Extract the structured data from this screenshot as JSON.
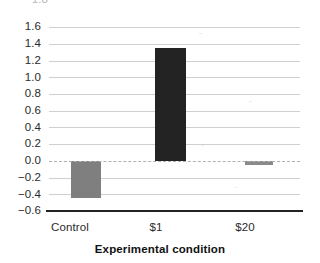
{
  "chart_data": {
    "type": "bar",
    "title": "",
    "xlabel": "Experimental condition",
    "ylabel": "",
    "categories": [
      "Control",
      "$1",
      "$20"
    ],
    "values": [
      -0.45,
      1.35,
      -0.05
    ],
    "series": [
      {
        "name": "Mean effect",
        "values": [
          -0.45,
          1.35,
          -0.05
        ],
        "colors": [
          "#7f7f7f",
          "#232323",
          "#8a8a8a"
        ]
      }
    ],
    "ylim": [
      -0.6,
      1.6
    ],
    "ytick_step": 0.2,
    "ytick_labels": [
      "1.6",
      "1.4",
      "1.2",
      "1.0",
      "0.8",
      "0.6",
      "0.4",
      "0.2",
      "0.0",
      "−0.2",
      "−0.4",
      "−0.6"
    ],
    "ytick_values": [
      1.6,
      1.4,
      1.2,
      1.0,
      0.8,
      0.6,
      0.4,
      0.2,
      0.0,
      -0.2,
      -0.4,
      -0.6
    ],
    "clipped_top_tick_label": "1.8",
    "grid": true,
    "grid_orientation": "horizontal",
    "zero_line": true,
    "zero_line_style": "dashed",
    "legend": false,
    "legend_position": "none",
    "annotations": []
  },
  "axis": {
    "y_labels": [
      "1.6",
      "1.4",
      "1.2",
      "1.0",
      "0.8",
      "0.6",
      "0.4",
      "0.2",
      "0.0",
      "−0.2",
      "−0.4",
      "−0.6"
    ],
    "x_labels": [
      "Control",
      "$1",
      "$20"
    ],
    "x_title": "Experimental condition",
    "clipped_label": "1.8"
  },
  "colors": {
    "bar_control": "#7f7f7f",
    "bar_one_dollar": "#232323",
    "bar_twenty_dollar": "#8a8a8a",
    "gridline": "#cfcfcf",
    "zero_line": "#b0b0b0",
    "axis": "#222222",
    "text": "#2a2a2a",
    "background": "#ffffff"
  }
}
